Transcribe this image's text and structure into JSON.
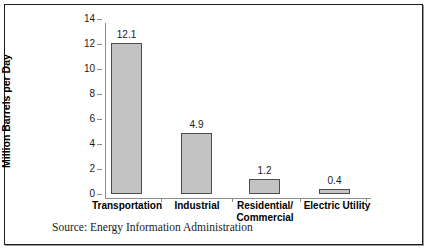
{
  "chart_data": {
    "type": "bar",
    "title": "",
    "xlabel": "",
    "ylabel": "Million Barrels per Day",
    "ylim": [
      0,
      14
    ],
    "yticks": [
      "0",
      "2",
      "4",
      "6",
      "8",
      "10",
      "12",
      "14"
    ],
    "grid": false,
    "legend": "none",
    "categories": [
      "Transportation",
      "Industrial",
      "Residential/ Commercial",
      "Electric Utility"
    ],
    "category_lines": [
      [
        "Transportation"
      ],
      [
        "Industrial"
      ],
      [
        "Residential/",
        "Commercial"
      ],
      [
        "Electric Utility"
      ]
    ],
    "values": [
      12.1,
      4.9,
      1.2,
      0.4
    ],
    "value_labels": [
      "12.1",
      "4.9",
      "1.2",
      "0.4"
    ],
    "bar_fill": "#c3c3c3",
    "bar_border": "#4c4c4c",
    "axis_color": "#8d8d8d"
  },
  "source_note": "Source: Energy Information Administration",
  "frame": {
    "border_color": "#1b1b1b",
    "background": "#ffffff"
  }
}
